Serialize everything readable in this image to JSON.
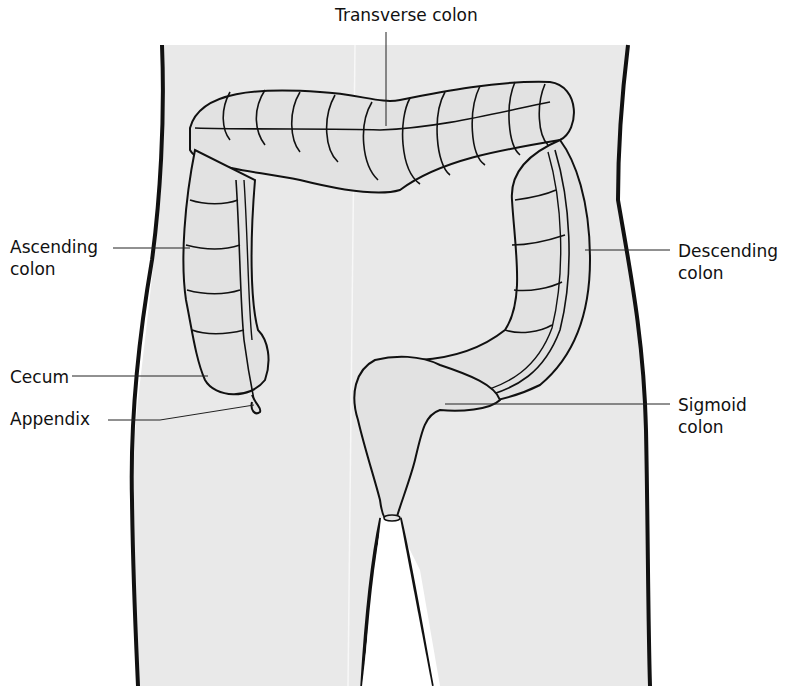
{
  "diagram": {
    "colors": {
      "body_fill": "#e9e9e9",
      "colon_fill": "#e2e2e2",
      "outline": "#111111",
      "background": "#ffffff"
    },
    "labels": [
      {
        "id": "transverse",
        "text": "Transverse colon"
      },
      {
        "id": "ascending",
        "text": "Ascending\ncolon"
      },
      {
        "id": "descending",
        "text": "Descending\ncolon"
      },
      {
        "id": "cecum",
        "text": "Cecum"
      },
      {
        "id": "appendix",
        "text": "Appendix"
      },
      {
        "id": "sigmoid",
        "text": "Sigmoid\ncolon"
      }
    ]
  }
}
